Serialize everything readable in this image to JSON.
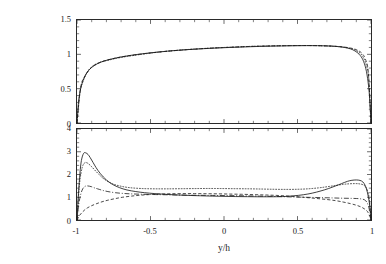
{
  "figure": {
    "background": "#ffffff",
    "axis_color": "#2a2a2a",
    "curve_color": "#1a1a1a",
    "xlabel": "y/h",
    "panels": [
      "mean-velocity",
      "rms-velocity"
    ]
  },
  "top_panel": {
    "ylabel_main": "<u>/U",
    "ylabel_sub": "m",
    "yticks": [
      "0",
      "0.5",
      "1",
      "1.5"
    ],
    "ytick_values": [
      0,
      0.5,
      1,
      1.5
    ]
  },
  "bottom_panel": {
    "ylabel_main_a": "u",
    "ylabel_sub_a": "rms",
    "ylabel_main_b": "/u",
    "ylabel_sub_b": "τ",
    "yticks": [
      "0",
      "1",
      "2",
      "3",
      "4"
    ],
    "ytick_values": [
      0,
      1,
      2,
      3,
      4
    ]
  },
  "xaxis": {
    "ticks": [
      "-1",
      "-0.5",
      "0",
      "0.5",
      "1"
    ],
    "tick_values": [
      -1,
      -0.5,
      0,
      0.5,
      1
    ]
  },
  "chart_data": [
    {
      "type": "line",
      "id": "mean-velocity-profile",
      "title": "",
      "xlabel": "y/h",
      "ylabel": "<u>/U_m",
      "xlim": [
        -1,
        1
      ],
      "ylim": [
        0,
        1.5
      ],
      "xticks": [
        -1,
        -0.5,
        0,
        0.5,
        1
      ],
      "yticks": [
        0,
        0.5,
        1,
        1.5
      ],
      "grid": false,
      "legend": "none",
      "series": [
        {
          "name": "solid",
          "style": "solid",
          "x": [
            -1.0,
            -0.99,
            -0.975,
            -0.955,
            -0.93,
            -0.9,
            -0.86,
            -0.82,
            -0.76,
            -0.7,
            -0.62,
            -0.54,
            -0.46,
            -0.36,
            -0.26,
            -0.16,
            -0.06,
            0.04,
            0.14,
            0.24,
            0.34,
            0.44,
            0.52,
            0.6,
            0.67,
            0.73,
            0.78,
            0.82,
            0.86,
            0.89,
            0.92,
            0.945,
            0.965,
            0.98,
            0.99,
            1.0
          ],
          "y": [
            0.0,
            0.3,
            0.5,
            0.64,
            0.74,
            0.81,
            0.865,
            0.9,
            0.935,
            0.962,
            0.99,
            1.012,
            1.031,
            1.051,
            1.067,
            1.08,
            1.091,
            1.1,
            1.108,
            1.115,
            1.12,
            1.124,
            1.126,
            1.127,
            1.125,
            1.12,
            1.112,
            1.1,
            1.08,
            1.05,
            1.0,
            0.92,
            0.79,
            0.6,
            0.38,
            0.0
          ]
        },
        {
          "name": "dotted-overlay",
          "style": "dotted",
          "x": [
            -1.0,
            -0.98,
            -0.96,
            -0.93,
            -0.89,
            -0.84,
            -0.78,
            -0.7,
            -0.6,
            -0.5,
            -0.4,
            -0.3,
            -0.2,
            -0.1,
            0.0,
            0.1,
            0.2,
            0.3,
            0.4,
            0.5,
            0.58,
            0.66,
            0.73,
            0.79,
            0.84,
            0.88,
            0.915,
            0.945,
            0.968,
            0.985,
            1.0
          ],
          "y": [
            0.0,
            0.44,
            0.6,
            0.745,
            0.835,
            0.885,
            0.918,
            0.955,
            0.988,
            1.018,
            1.043,
            1.062,
            1.077,
            1.09,
            1.1,
            1.109,
            1.117,
            1.122,
            1.126,
            1.128,
            1.128,
            1.125,
            1.119,
            1.11,
            1.095,
            1.073,
            1.035,
            0.965,
            0.845,
            0.64,
            0.0
          ]
        },
        {
          "name": "dashed-overlay",
          "style": "dashed",
          "x": [
            -1.0,
            -0.975,
            -0.945,
            -0.9,
            -0.84,
            -0.76,
            -0.66,
            -0.54,
            -0.42,
            -0.3,
            -0.18,
            -0.06,
            0.06,
            0.18,
            0.3,
            0.42,
            0.54,
            0.64,
            0.73,
            0.8,
            0.86,
            0.9,
            0.935,
            0.962,
            0.982,
            1.0
          ],
          "y": [
            0.0,
            0.52,
            0.685,
            0.81,
            0.885,
            0.935,
            0.975,
            1.01,
            1.038,
            1.06,
            1.078,
            1.093,
            1.105,
            1.115,
            1.122,
            1.126,
            1.128,
            1.126,
            1.12,
            1.11,
            1.092,
            1.068,
            1.022,
            0.93,
            0.73,
            0.0
          ]
        }
      ]
    },
    {
      "type": "line",
      "id": "rms-velocity-profile",
      "title": "",
      "xlabel": "y/h",
      "ylabel": "u_rms/u_tau",
      "xlim": [
        -1,
        1
      ],
      "ylim": [
        0,
        4
      ],
      "xticks": [
        -1,
        -0.5,
        0,
        0.5,
        1
      ],
      "yticks": [
        0,
        1,
        2,
        3,
        4
      ],
      "grid": false,
      "legend": "none",
      "series": [
        {
          "name": "solid",
          "style": "solid",
          "x": [
            -1.0,
            -0.99,
            -0.98,
            -0.97,
            -0.955,
            -0.94,
            -0.925,
            -0.91,
            -0.89,
            -0.87,
            -0.84,
            -0.8,
            -0.76,
            -0.71,
            -0.66,
            -0.6,
            -0.54,
            -0.47,
            -0.4,
            -0.32,
            -0.24,
            -0.16,
            -0.08,
            0.0,
            0.08,
            0.16,
            0.24,
            0.32,
            0.4,
            0.47,
            0.54,
            0.6,
            0.66,
            0.71,
            0.76,
            0.8,
            0.84,
            0.87,
            0.9,
            0.925,
            0.945,
            0.962,
            0.976,
            0.988,
            0.996,
            1.0
          ],
          "y": [
            0.0,
            1.15,
            2.05,
            2.62,
            2.93,
            2.95,
            2.88,
            2.74,
            2.52,
            2.3,
            2.03,
            1.76,
            1.57,
            1.42,
            1.32,
            1.25,
            1.2,
            1.16,
            1.13,
            1.1,
            1.08,
            1.065,
            1.05,
            1.04,
            1.03,
            1.025,
            1.02,
            1.02,
            1.03,
            1.06,
            1.11,
            1.18,
            1.28,
            1.38,
            1.5,
            1.6,
            1.7,
            1.745,
            1.76,
            1.74,
            1.67,
            1.5,
            1.2,
            0.8,
            0.4,
            0.0
          ]
        },
        {
          "name": "dotted-upper",
          "style": "dotted",
          "x": [
            -1.0,
            -0.99,
            -0.98,
            -0.965,
            -0.95,
            -0.935,
            -0.92,
            -0.9,
            -0.88,
            -0.85,
            -0.82,
            -0.78,
            -0.74,
            -0.69,
            -0.64,
            -0.58,
            -0.52,
            -0.45,
            -0.38,
            -0.3,
            -0.22,
            -0.14,
            -0.06,
            0.02,
            0.1,
            0.18,
            0.26,
            0.34,
            0.42,
            0.5,
            0.57,
            0.64,
            0.7,
            0.76,
            0.81,
            0.85,
            0.89,
            0.92,
            0.945,
            0.965,
            0.98,
            0.99,
            1.0
          ],
          "y": [
            0.0,
            1.0,
            1.75,
            2.3,
            2.5,
            2.52,
            2.46,
            2.34,
            2.2,
            2.0,
            1.82,
            1.66,
            1.55,
            1.47,
            1.42,
            1.39,
            1.375,
            1.37,
            1.37,
            1.375,
            1.38,
            1.385,
            1.385,
            1.38,
            1.375,
            1.37,
            1.36,
            1.35,
            1.345,
            1.35,
            1.37,
            1.41,
            1.46,
            1.52,
            1.565,
            1.59,
            1.6,
            1.59,
            1.55,
            1.44,
            1.2,
            0.85,
            0.0
          ]
        },
        {
          "name": "dash-dot",
          "style": "dashdot",
          "x": [
            -1.0,
            -0.99,
            -0.975,
            -0.96,
            -0.945,
            -0.93,
            -0.915,
            -0.9,
            -0.88,
            -0.86,
            -0.83,
            -0.79,
            -0.74,
            -0.68,
            -0.62,
            -0.55,
            -0.48,
            -0.4,
            -0.32,
            -0.24,
            -0.16,
            -0.08,
            0.0,
            0.08,
            0.16,
            0.24,
            0.32,
            0.4,
            0.48,
            0.55,
            0.62,
            0.68,
            0.74,
            0.79,
            0.83,
            0.87,
            0.9,
            0.93,
            0.955,
            0.972,
            0.985,
            0.994,
            1.0
          ],
          "y": [
            0.0,
            0.62,
            1.12,
            1.38,
            1.48,
            1.5,
            1.485,
            1.46,
            1.41,
            1.37,
            1.31,
            1.25,
            1.2,
            1.165,
            1.145,
            1.13,
            1.12,
            1.11,
            1.1,
            1.09,
            1.085,
            1.08,
            1.075,
            1.07,
            1.06,
            1.05,
            1.04,
            1.025,
            1.01,
            1.0,
            0.99,
            0.98,
            0.97,
            0.96,
            0.955,
            0.95,
            0.945,
            0.93,
            0.89,
            0.78,
            0.56,
            0.3,
            0.0
          ]
        },
        {
          "name": "dashed-lower",
          "style": "dashed",
          "x": [
            -1.0,
            -0.985,
            -0.97,
            -0.95,
            -0.93,
            -0.9,
            -0.87,
            -0.83,
            -0.79,
            -0.74,
            -0.69,
            -0.63,
            -0.57,
            -0.5,
            -0.43,
            -0.36,
            -0.28,
            -0.2,
            -0.12,
            -0.04,
            0.04,
            0.12,
            0.2,
            0.28,
            0.36,
            0.44,
            0.52,
            0.58,
            0.64,
            0.7,
            0.76,
            0.81,
            0.86,
            0.9,
            0.93,
            0.955,
            0.975,
            0.99,
            1.0
          ],
          "y": [
            0.0,
            0.18,
            0.3,
            0.43,
            0.53,
            0.63,
            0.71,
            0.8,
            0.87,
            0.94,
            1.0,
            1.05,
            1.09,
            1.12,
            1.14,
            1.155,
            1.16,
            1.16,
            1.155,
            1.15,
            1.14,
            1.13,
            1.115,
            1.1,
            1.08,
            1.05,
            1.01,
            0.975,
            0.94,
            0.9,
            0.85,
            0.79,
            0.72,
            0.65,
            0.58,
            0.49,
            0.38,
            0.2,
            0.0
          ]
        }
      ]
    }
  ]
}
